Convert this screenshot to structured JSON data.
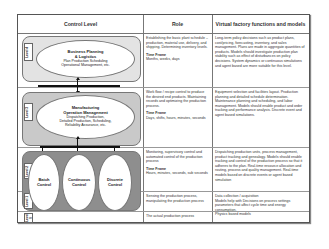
{
  "headers": {
    "control_level": "Control Level",
    "role": "Role",
    "virtual_factory": "Virtual factory functions and models"
  },
  "levels": [
    {
      "label": "Level 4",
      "node": {
        "title_line1": "Business Planning",
        "title_line2": "& Logistics",
        "sub_line1": "Plan Production Scheduling",
        "sub_line2": "Operational Management, etc."
      },
      "role": "Establishing the basic plant schedule – production, material use, delivery, and shipping. Determining inventory levels.",
      "time_frame_label": "Time Frame",
      "time_frame": "Months, weeks, days",
      "virtual_factory": "Long-term policy decisions such as product plans, cost/pricing, forecasting, inventory, and sales management. Plans are made in aggregate quantities of products. Models should investigate production plan stability such as effect of disturbances on policy decisions. System dynamics or continuous simulations and agent based are more suitable for this level."
    },
    {
      "label": "Level 3",
      "node": {
        "title_line1": "Manufacturing",
        "title_line2": "Operation Management",
        "sub_line1": "Dispatching Production,",
        "sub_line2": "Detailed Production, Scheduling,",
        "sub_line3": "Reliability Assurance, etc."
      },
      "role": "Work flow / recipe control to produce the desired end products. Maintaining records and optimizing the production process.",
      "time_frame_label": "Time Frame",
      "time_frame": "Days, shifts, hours, minutes, seconds",
      "virtual_factory": "Equipment selection and facilities layout. Production planning and detailed schedule determination. Maintenance planning and scheduling, and labor management. Models should enable product and order tracking and performance analysis. Discrete event and agent based simulations."
    },
    {
      "label": "Level 2",
      "nodes": [
        {
          "line1": "Batch",
          "line2": "Control"
        },
        {
          "line1": "Continuous",
          "line2": "Control"
        },
        {
          "line1": "Discrete",
          "line2": "Control"
        }
      ],
      "role": "Monitoring, supervisory control and automated control of the production process",
      "time_frame_label": "Time Frame",
      "time_frame": "Hours, minutes, seconds, sub seconds",
      "virtual_factory": "Dispatching production units, process management, product tracking and genealogy. Models should enable tracking and control of the production process so that it adheres to the plan. Real-time resource allocation and routing, process and quality management. Real-time models based on discrete events or agent based simulation"
    },
    {
      "label": "Level 1",
      "role": "Sensing the production process, manipulating the production process",
      "virtual_factory": "Data collection / acquisition\nModels help with Decisions on process settings parameters that affect cycle time and energy consumption.\nPhysics based models"
    },
    {
      "label": "Level 0",
      "role": "The actual production process",
      "virtual_factory": ""
    }
  ],
  "colors": {
    "level4_band": "#e3e3e3",
    "level3_band": "#c9c9c9",
    "level2_band": "#8e8e8e",
    "border": "#555555"
  }
}
